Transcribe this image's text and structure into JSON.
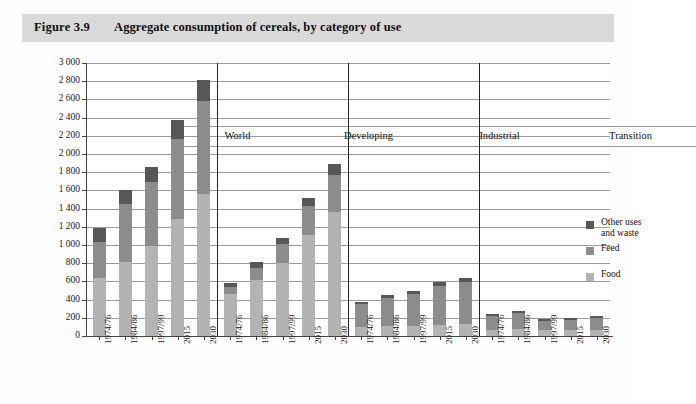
{
  "figure": {
    "number": "Figure 3.9",
    "title": "Aggregate consumption of cereals, by category of use"
  },
  "colors": {
    "food": "#b3b3b3",
    "feed": "#8c8c8c",
    "other": "#575757",
    "title_band": "#d9d9d9",
    "gridline": "#9a9a9a",
    "axis": "#444444"
  },
  "chart_data": {
    "type": "bar",
    "stacked": true,
    "title": "Aggregate consumption of cereals, by category of use",
    "xlabel": "",
    "ylabel": "Million tonnes",
    "ylim": [
      0,
      3000
    ],
    "ytick_step": 200,
    "yticks": [
      "0",
      "200",
      "400",
      "600",
      "800",
      "1 000",
      "1 200",
      "1 400",
      "1 600",
      "1 800",
      "2 000",
      "2 200",
      "2 400",
      "2 600",
      "2 800",
      "3 000"
    ],
    "grid": true,
    "legend_position": "inside-right",
    "legend": [
      {
        "name": "Other uses and waste",
        "color": "#575757"
      },
      {
        "name": "Feed",
        "color": "#8c8c8c"
      },
      {
        "name": "Food",
        "color": "#b3b3b3"
      }
    ],
    "series_order": [
      "Food",
      "Feed",
      "Other uses and waste"
    ],
    "categories": [
      "1974/76",
      "1984/86",
      "1997/99",
      "2015",
      "2030"
    ],
    "groups": [
      {
        "name": "World",
        "bars": [
          {
            "category": "1974/76",
            "food": 635,
            "feed": 400,
            "other": 150,
            "total": 1185
          },
          {
            "category": "1984/86",
            "food": 810,
            "feed": 640,
            "other": 150,
            "total": 1600
          },
          {
            "category": "1997/99",
            "food": 990,
            "feed": 700,
            "other": 170,
            "total": 1860
          },
          {
            "category": "2015",
            "food": 1290,
            "feed": 880,
            "other": 200,
            "total": 2370
          },
          {
            "category": "2030",
            "food": 1560,
            "feed": 1020,
            "other": 230,
            "total": 2810
          }
        ]
      },
      {
        "name": "Developing",
        "bars": [
          {
            "category": "1974/76",
            "food": 465,
            "feed": 75,
            "other": 40,
            "total": 580
          },
          {
            "category": "1984/86",
            "food": 620,
            "feed": 130,
            "other": 60,
            "total": 810
          },
          {
            "category": "1997/99",
            "food": 800,
            "feed": 210,
            "other": 70,
            "total": 1080
          },
          {
            "category": "2015",
            "food": 1105,
            "feed": 320,
            "other": 95,
            "total": 1520
          },
          {
            "category": "2030",
            "food": 1360,
            "feed": 410,
            "other": 120,
            "total": 1890
          }
        ]
      },
      {
        "name": "Industrial",
        "bars": [
          {
            "category": "1974/76",
            "food": 100,
            "feed": 250,
            "other": 25,
            "total": 375
          },
          {
            "category": "1984/86",
            "food": 110,
            "feed": 310,
            "other": 30,
            "total": 450
          },
          {
            "category": "1997/99",
            "food": 115,
            "feed": 350,
            "other": 35,
            "total": 500
          },
          {
            "category": "2015",
            "food": 125,
            "feed": 420,
            "other": 45,
            "total": 590
          },
          {
            "category": "2030",
            "food": 135,
            "feed": 455,
            "other": 50,
            "total": 640
          }
        ]
      },
      {
        "name": "Transition",
        "bars": [
          {
            "category": "1974/76",
            "food": 70,
            "feed": 150,
            "other": 20,
            "total": 240
          },
          {
            "category": "1984/86",
            "food": 75,
            "feed": 180,
            "other": 25,
            "total": 280
          },
          {
            "category": "1997/99",
            "food": 65,
            "feed": 100,
            "other": 20,
            "total": 185
          },
          {
            "category": "2015",
            "food": 65,
            "feed": 115,
            "other": 20,
            "total": 200
          },
          {
            "category": "2030",
            "food": 70,
            "feed": 130,
            "other": 25,
            "total": 225
          }
        ]
      }
    ]
  }
}
